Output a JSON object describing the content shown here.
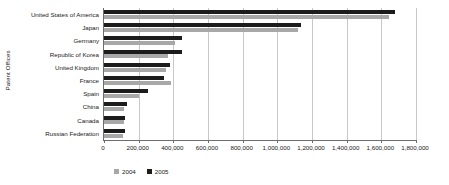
{
  "chart_data": {
    "type": "bar",
    "orientation": "horizontal",
    "title": "",
    "xlabel": "",
    "ylabel": "Patent Offices",
    "xlim": [
      0,
      1800000
    ],
    "xticks": [
      0,
      200000,
      400000,
      600000,
      800000,
      1000000,
      1200000,
      1400000,
      1600000,
      1800000
    ],
    "xtick_labels": [
      "0",
      "200,000",
      "400,000",
      "600,000",
      "800,000",
      "1,000,000",
      "1,200,000",
      "1,400,000",
      "1,600,000",
      "1,800,000"
    ],
    "grid": true,
    "legend_position": "bottom-left",
    "categories": [
      "United States of America",
      "Japan",
      "Germany",
      "Republic of Korea",
      "United Kingdom",
      "France",
      "Spain",
      "China",
      "Canada",
      "Russian Federation"
    ],
    "series": [
      {
        "name": "2004",
        "color": "#a8a8a8",
        "values": [
          1645000,
          1120000,
          410000,
          370000,
          358000,
          385000,
          200000,
          115000,
          115000,
          112000
        ]
      },
      {
        "name": "2005",
        "color": "#1c1c1c",
        "values": [
          1680000,
          1137000,
          450000,
          450000,
          380000,
          345000,
          255000,
          130000,
          122000,
          120000
        ]
      }
    ]
  },
  "legend": {
    "items": [
      {
        "label": "2004",
        "swatch_name": "legend-swatch-2004"
      },
      {
        "label": "2005",
        "swatch_name": "legend-swatch-2005"
      }
    ]
  }
}
